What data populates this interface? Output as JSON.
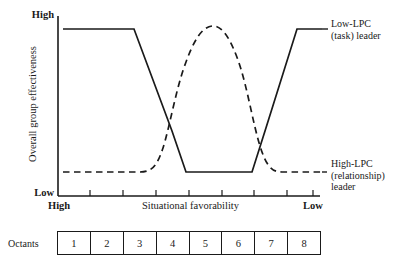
{
  "chart_data": {
    "type": "line",
    "title": "",
    "xlabel": "Situational favorability",
    "ylabel": "Overall group effectiveness",
    "x_axis": {
      "left_label": "High",
      "right_label": "Low",
      "ticks": 8,
      "range_note": "Situational favorability decreases left to right"
    },
    "y_axis": {
      "top_label": "High",
      "bottom_label": "Low",
      "ylim": [
        0,
        1
      ],
      "grid": false
    },
    "legend_position": "right",
    "categories": [
      "1",
      "2",
      "3",
      "4",
      "5",
      "6",
      "7",
      "8"
    ],
    "series": [
      {
        "name": "Low-LPC (task) leader",
        "style": "solid",
        "color": "#1a1a1a",
        "values": [
          1.0,
          1.0,
          1.0,
          0.5,
          0.08,
          0.08,
          0.5,
          1.0
        ],
        "shape": "U-shaped: high at favorable extremes, low in moderate favorability"
      },
      {
        "name": "High-LPC (relationship) leader",
        "style": "dashed",
        "color": "#1a1a1a",
        "values": [
          0.12,
          0.12,
          0.12,
          0.55,
          0.95,
          0.95,
          0.55,
          0.12
        ],
        "shape": "Inverted-U: low at extremes, high in moderate favorability"
      }
    ]
  },
  "axis": {
    "y_top": "High",
    "y_bottom": "Low",
    "y_title": "Overall group effectiveness",
    "x_left": "High",
    "x_right": "Low",
    "x_title": "Situational favorability"
  },
  "legend": {
    "low_lpc": {
      "line1": "Low-LPC",
      "line2": "(task) leader"
    },
    "high_lpc": {
      "line1": "High-LPC",
      "line2": "(relationship)",
      "line3": "leader"
    }
  },
  "octants": {
    "label": "Octants",
    "cells": [
      "1",
      "2",
      "3",
      "4",
      "5",
      "6",
      "7",
      "8"
    ]
  },
  "colors": {
    "ink": "#1a1a1a",
    "background": "#ffffff"
  }
}
